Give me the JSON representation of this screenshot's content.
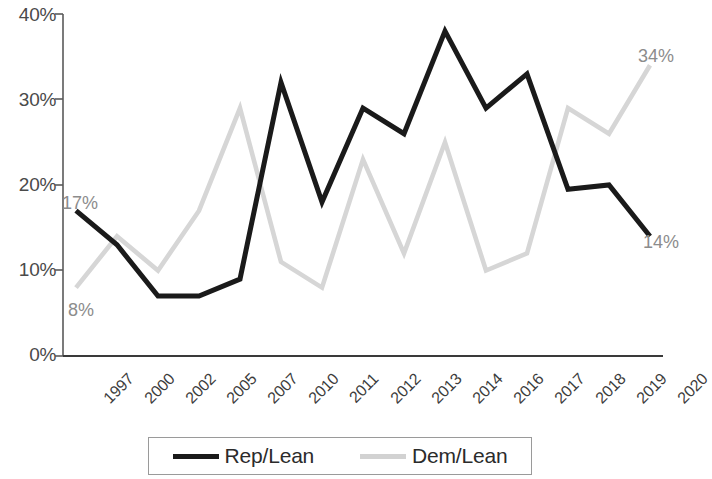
{
  "chart_data": {
    "type": "line",
    "title": "",
    "subtitle": "",
    "xlabel": "",
    "ylabel": "",
    "categories": [
      "1997",
      "2000",
      "2002",
      "2005",
      "2007",
      "2010",
      "2011",
      "2012",
      "2013",
      "2014",
      "2016",
      "2017",
      "2018",
      "2019",
      "2020"
    ],
    "series": [
      {
        "name": "Rep/Lean",
        "color": "#1a1a1a",
        "style": "solid",
        "values": [
          17,
          13,
          7,
          7,
          9,
          32,
          18,
          29,
          26,
          38,
          29,
          33,
          19.5,
          20,
          14
        ]
      },
      {
        "name": "Dem/Lean",
        "color": "#d6d6d6",
        "style": "solid",
        "values": [
          8,
          14,
          10,
          17,
          29,
          11,
          8,
          23,
          12,
          25,
          10,
          12,
          29,
          26,
          34
        ]
      }
    ],
    "ylim": [
      0,
      40
    ],
    "ytick_values": [
      0,
      10,
      20,
      30,
      40
    ],
    "ytick_labels": [
      "0%",
      "10%",
      "20%",
      "30%",
      "40%"
    ],
    "grid": false,
    "legend_position": "bottom",
    "annotations": [
      {
        "text": "17%",
        "series": "Rep/Lean",
        "category": "1997",
        "value": 17,
        "x": 62,
        "y": 193
      },
      {
        "text": "8%",
        "series": "Dem/Lean",
        "category": "1997",
        "value": 8,
        "x": 68,
        "y": 300
      },
      {
        "text": "34%",
        "series": "Dem/Lean",
        "category": "2020",
        "value": 34,
        "x": 638,
        "y": 46
      },
      {
        "text": "14%",
        "series": "Rep/Lean",
        "category": "2020",
        "value": 14,
        "x": 643,
        "y": 232
      }
    ]
  },
  "axis": {
    "y_labels": [
      "40%",
      "30%",
      "20%",
      "10%",
      "0%"
    ],
    "x_labels": [
      "1997",
      "2000",
      "2002",
      "2005",
      "2007",
      "2010",
      "2011",
      "2012",
      "2013",
      "2014",
      "2016",
      "2017",
      "2018",
      "2019",
      "2020"
    ]
  },
  "legend": {
    "entries": [
      {
        "label": "Rep/Lean",
        "color": "#1a1a1a"
      },
      {
        "label": "Dem/Lean",
        "color": "#d2d2d2"
      }
    ]
  },
  "colors": {
    "rep": "#1a1a1a",
    "dem": "#d4d4d4",
    "axis": "#5a5a5a",
    "label": "#4a4a4a",
    "annotation": "#8c8c8c",
    "background": "#ffffff"
  }
}
